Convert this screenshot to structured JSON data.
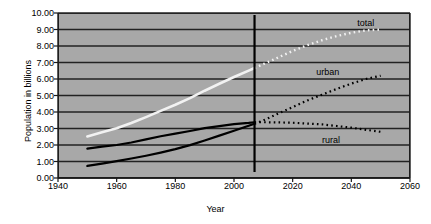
{
  "chart_data": {
    "type": "line",
    "title": "",
    "xlabel": "Year",
    "ylabel": "Population in billions",
    "xlim": [
      1940,
      2060
    ],
    "ylim": [
      0,
      10
    ],
    "xticks": [
      1940,
      1960,
      1980,
      2000,
      2020,
      2040,
      2060
    ],
    "yticks": [
      "0.00",
      "1.00",
      "2.00",
      "3.00",
      "4.00",
      "5.00",
      "6.00",
      "7.00",
      "8.00",
      "9.00",
      "10.00"
    ],
    "grid": "horizontal",
    "legend_position": "inline-right-annotations",
    "projection_divider_year": 2007,
    "series": [
      {
        "name": "total",
        "label": "total",
        "color": "#f2f2f2",
        "historical_style": "solid",
        "projection_style": "dotted",
        "x": [
          1950,
          1955,
          1960,
          1965,
          1970,
          1975,
          1980,
          1985,
          1990,
          1995,
          2000,
          2005,
          2007,
          2010,
          2015,
          2020,
          2025,
          2030,
          2035,
          2040,
          2045,
          2050
        ],
        "values": [
          2.52,
          2.77,
          3.02,
          3.33,
          3.69,
          4.07,
          4.44,
          4.84,
          5.29,
          5.71,
          6.12,
          6.51,
          6.67,
          6.9,
          7.3,
          7.7,
          8.05,
          8.35,
          8.6,
          8.8,
          8.95,
          9.0
        ]
      },
      {
        "name": "urban",
        "label": "urban",
        "color": "#000000",
        "historical_style": "solid",
        "projection_style": "dotted",
        "x": [
          1950,
          1955,
          1960,
          1965,
          1970,
          1975,
          1980,
          1985,
          1990,
          1995,
          2000,
          2005,
          2007,
          2010,
          2015,
          2020,
          2025,
          2030,
          2035,
          2040,
          2045,
          2050
        ],
        "values": [
          0.73,
          0.87,
          1.02,
          1.18,
          1.35,
          1.54,
          1.75,
          1.99,
          2.27,
          2.57,
          2.86,
          3.17,
          3.29,
          3.49,
          3.9,
          4.3,
          4.7,
          5.05,
          5.4,
          5.72,
          6.0,
          6.2
        ]
      },
      {
        "name": "rural",
        "label": "rural",
        "color": "#000000",
        "historical_style": "solid",
        "projection_style": "dotted",
        "x": [
          1950,
          1955,
          1960,
          1965,
          1970,
          1975,
          1980,
          1985,
          1990,
          1995,
          2000,
          2005,
          2007,
          2010,
          2015,
          2020,
          2025,
          2030,
          2035,
          2040,
          2045,
          2050
        ],
        "values": [
          1.78,
          1.9,
          2.0,
          2.15,
          2.34,
          2.53,
          2.69,
          2.85,
          3.02,
          3.14,
          3.26,
          3.34,
          3.38,
          3.38,
          3.37,
          3.35,
          3.3,
          3.25,
          3.15,
          3.05,
          2.92,
          2.8
        ]
      }
    ],
    "annotations": [
      {
        "name": "total",
        "text": "total",
        "x": 2042,
        "y": 9.35
      },
      {
        "name": "urban",
        "text": "urban",
        "x": 2028,
        "y": 6.35
      },
      {
        "name": "rural",
        "text": "rural",
        "x": 2030,
        "y": 2.25
      }
    ]
  },
  "colors": {
    "plot_background": "#a8a8a8",
    "gridline": "#222222",
    "axis": "#1a1a1a",
    "total_series": "#f2f2f2",
    "urban_series": "#000000",
    "rural_series": "#000000",
    "page_background": "#ffffff"
  }
}
